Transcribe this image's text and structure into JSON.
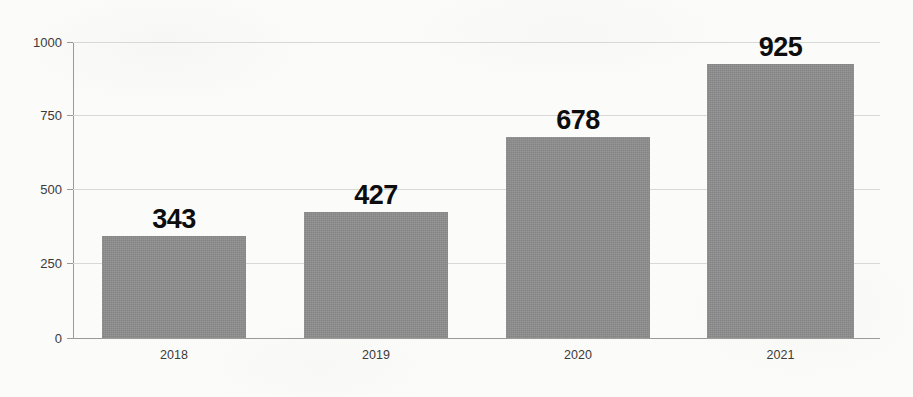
{
  "chart_data": {
    "type": "bar",
    "title": "",
    "subtitle": "",
    "xlabel": "",
    "ylabel": "",
    "categories": [
      "2018",
      "2019",
      "2020",
      "2021"
    ],
    "values": [
      343,
      427,
      678,
      925
    ],
    "value_labels": [
      "343",
      "427",
      "678",
      "925"
    ],
    "series": [
      {
        "name": "",
        "values": [
          343,
          427,
          678,
          925
        ]
      }
    ],
    "ylim": [
      0,
      1000
    ],
    "yticks": [
      0,
      250,
      500,
      750,
      1000
    ],
    "ytick_labels": [
      "0",
      "250",
      "500",
      "750",
      "1000"
    ],
    "grid": true,
    "grid_axis": "y",
    "legend": false,
    "legend_position": "none",
    "bar_color": "#8d8d8d",
    "background_color": "#fbfbf9",
    "gridline_color": "#d8d8d4",
    "axis_color": "#9a9a96",
    "label_color": "#0d0d0d",
    "tick_label_color": "#3a3a3a"
  }
}
